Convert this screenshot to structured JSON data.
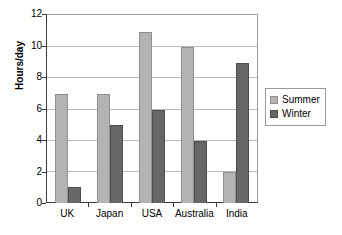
{
  "chart_data": {
    "type": "bar",
    "title": "",
    "subtitle": "",
    "xlabel": "",
    "ylabel": "Hours/day",
    "categories": [
      "UK",
      "Japan",
      "USA",
      "Australia",
      "India"
    ],
    "series": [
      {
        "name": "Summer",
        "values": [
          7,
          7,
          11,
          10,
          2
        ],
        "color": "#b3b3b3"
      },
      {
        "name": "Winter",
        "values": [
          1,
          5,
          6,
          4,
          9
        ],
        "color": "#676767"
      }
    ],
    "ylim": [
      0,
      12
    ],
    "ytick_labels": [
      "12",
      "10",
      "8",
      "6",
      "4",
      "2",
      "0"
    ],
    "ytick_values": [
      12,
      10,
      8,
      6,
      4,
      2,
      0
    ],
    "ytick_step": 2,
    "grid": "horizontal",
    "legend_position": "right",
    "annotations": []
  },
  "legend": {
    "entries": [
      {
        "label": "Summer",
        "swatch": "summer-swatch"
      },
      {
        "label": "Winter",
        "swatch": "winter-swatch"
      }
    ]
  }
}
